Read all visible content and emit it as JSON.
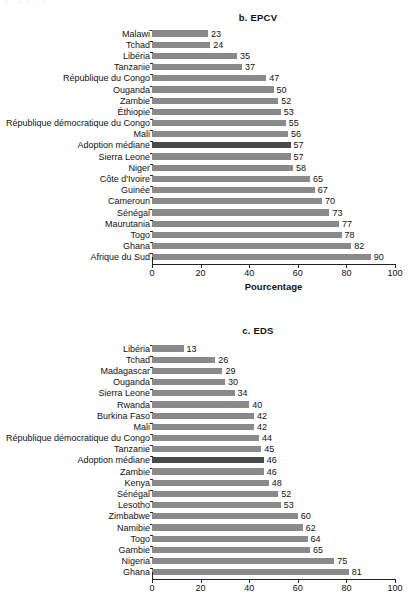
{
  "page": {
    "top_remnant": "b. EPCV"
  },
  "charts": [
    {
      "id": "epcv",
      "title": "b. EPCV",
      "xlabel": "Pourcentage",
      "show_xlabel": true,
      "xticks": [
        0,
        20,
        40,
        60,
        80,
        100
      ],
      "xlim": [
        0,
        100
      ],
      "median_category": "Adoption médiane",
      "categories": [
        "Malawi",
        "Tchad",
        "Libéria",
        "Tanzanie",
        "République du Congo",
        "Ouganda",
        "Zambie",
        "Éthiopie",
        "République démocratique du Congo",
        "Mali",
        "Adoption médiane",
        "Sierra Leone",
        "Niger",
        "Côte d'Ivoire",
        "Guinée",
        "Cameroun",
        "Sénégal",
        "Maurutania",
        "Togo",
        "Ghana",
        "Afrique du Sud"
      ],
      "values": [
        23,
        24,
        35,
        37,
        47,
        50,
        52,
        53,
        55,
        56,
        57,
        57,
        58,
        65,
        67,
        70,
        73,
        77,
        78,
        82,
        90
      ]
    },
    {
      "id": "eds",
      "title": "c. EDS",
      "xlabel": "",
      "show_xlabel": false,
      "xticks": [
        0,
        20,
        40,
        60,
        80,
        100
      ],
      "xlim": [
        0,
        100
      ],
      "median_category": "Adoption médiane",
      "categories": [
        "Libéria",
        "Tchad",
        "Madagascar",
        "Ouganda",
        "Sierra Leone",
        "Rwanda",
        "Burkina Faso",
        "Mali",
        "République démocratique du Congo",
        "Tanzanie",
        "Adoption médiane",
        "Zambie",
        "Kenya",
        "Sénégal",
        "Lesotho",
        "Zimbabwe",
        "Namibie",
        "Togo",
        "Gambie",
        "Nigeria",
        "Ghana"
      ],
      "values": [
        13,
        26,
        29,
        30,
        34,
        40,
        42,
        42,
        44,
        45,
        46,
        46,
        48,
        52,
        53,
        60,
        62,
        64,
        65,
        75,
        81
      ]
    }
  ],
  "chart_data": [
    {
      "type": "bar",
      "orientation": "horizontal",
      "title": "b. EPCV",
      "xlabel": "Pourcentage",
      "ylabel": "",
      "xlim": [
        0,
        100
      ],
      "xticks": [
        0,
        20,
        40,
        60,
        80,
        100
      ],
      "grid": false,
      "legend": "none",
      "bar_color": "#8a8a8a",
      "highlight_color": "#494949",
      "highlight_category": "Adoption médiane",
      "categories": [
        "Malawi",
        "Tchad",
        "Libéria",
        "Tanzanie",
        "République du Congo",
        "Ouganda",
        "Zambie",
        "Éthiopie",
        "République démocratique du Congo",
        "Mali",
        "Adoption médiane",
        "Sierra Leone",
        "Niger",
        "Côte d'Ivoire",
        "Guinée",
        "Cameroun",
        "Sénégal",
        "Maurutania",
        "Togo",
        "Ghana",
        "Afrique du Sud"
      ],
      "values": [
        23,
        24,
        35,
        37,
        47,
        50,
        52,
        53,
        55,
        56,
        57,
        57,
        58,
        65,
        67,
        70,
        73,
        77,
        78,
        82,
        90
      ]
    },
    {
      "type": "bar",
      "orientation": "horizontal",
      "title": "c. EDS",
      "xlabel": "",
      "ylabel": "",
      "xlim": [
        0,
        100
      ],
      "xticks": [
        0,
        20,
        40,
        60,
        80,
        100
      ],
      "grid": false,
      "legend": "none",
      "bar_color": "#8a8a8a",
      "highlight_color": "#494949",
      "highlight_category": "Adoption médiane",
      "categories": [
        "Libéria",
        "Tchad",
        "Madagascar",
        "Ouganda",
        "Sierra Leone",
        "Rwanda",
        "Burkina Faso",
        "Mali",
        "République démocratique du Congo",
        "Tanzanie",
        "Adoption médiane",
        "Zambie",
        "Kenya",
        "Sénégal",
        "Lesotho",
        "Zimbabwe",
        "Namibie",
        "Togo",
        "Gambie",
        "Nigeria",
        "Ghana"
      ],
      "values": [
        13,
        26,
        29,
        30,
        34,
        40,
        42,
        42,
        44,
        45,
        46,
        46,
        48,
        52,
        53,
        60,
        62,
        64,
        65,
        75,
        81
      ]
    }
  ]
}
